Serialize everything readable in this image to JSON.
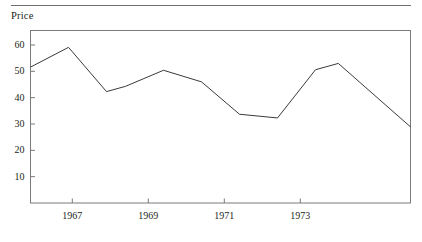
{
  "figure": {
    "has_top_rule": true,
    "background": "#ffffff",
    "line_color": "#3a3a3a",
    "frame_color": "#7a7a7a",
    "text_color": "#231f20"
  },
  "chart_data": {
    "type": "line",
    "title": "",
    "ylabel": "Price",
    "xlabel": "",
    "grid": false,
    "legend": null,
    "ylim": [
      0,
      65.5
    ],
    "xlim": [
      1965.9,
      1975.9
    ],
    "ytick_labels": [
      "10",
      "20",
      "30",
      "40",
      "50",
      "60"
    ],
    "yticks": [
      10,
      20,
      30,
      40,
      50,
      60
    ],
    "xtick_labels": [
      "1967",
      "1969",
      "1971",
      "1973"
    ],
    "xticks": [
      1967,
      1969,
      1971,
      1973
    ],
    "x": [
      1965.9,
      1966.9,
      1967.9,
      1968.4,
      1969.4,
      1970.4,
      1971.4,
      1972.4,
      1973.4,
      1974.0,
      1975.9
    ],
    "values": [
      51.6,
      59.1,
      42.3,
      44.3,
      50.4,
      46.0,
      33.7,
      32.3,
      50.6,
      53.0,
      28.9
    ],
    "series": [
      {
        "name": "Price",
        "values": [
          51.6,
          59.1,
          42.3,
          44.3,
          50.4,
          46.0,
          33.7,
          32.3,
          50.6,
          53.0,
          28.9
        ]
      }
    ]
  }
}
